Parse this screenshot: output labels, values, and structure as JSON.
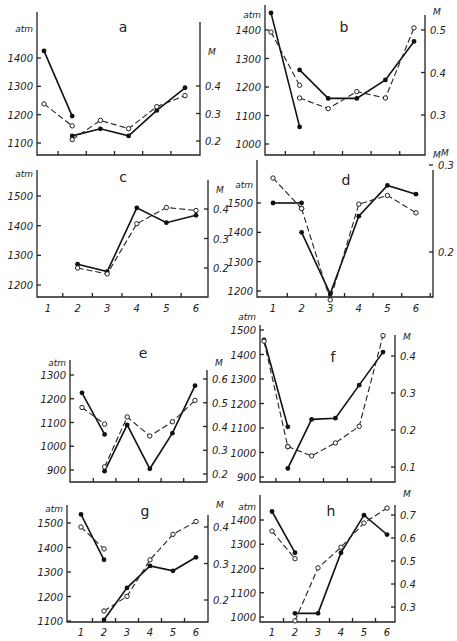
{
  "chart_data": [
    {
      "panel": "a",
      "type": "line",
      "left_axis": {
        "label": "atm",
        "ticks": [
          1100,
          1200,
          1300,
          1400
        ]
      },
      "right_axis": {
        "label": "M",
        "ticks": [
          0.2,
          0.3,
          0.4
        ]
      },
      "x": [
        1,
        2,
        3,
        4,
        5,
        6
      ],
      "series": [
        {
          "name": "pressure (atm)",
          "style": "solid-filled",
          "segments": [
            [
              [
                1,
                1425
              ],
              [
                2,
                1195
              ]
            ],
            [
              [
                2,
                1125
              ],
              [
                3,
                1150
              ],
              [
                4,
                1125
              ],
              [
                5,
                1215
              ],
              [
                6,
                1295
              ]
            ]
          ]
        },
        {
          "name": "M",
          "style": "dashed-open",
          "segments": [
            [
              [
                1,
                0.335
              ],
              [
                2,
                0.255
              ]
            ],
            [
              [
                2,
                0.205
              ],
              [
                3,
                0.275
              ],
              [
                4,
                0.245
              ],
              [
                5,
                0.325
              ],
              [
                6,
                0.365
              ]
            ]
          ]
        }
      ]
    },
    {
      "panel": "b",
      "type": "line",
      "left_axis": {
        "label": "atm",
        "ticks": [
          1000,
          1100,
          1200,
          1300,
          1400
        ]
      },
      "right_axis": {
        "label": "M",
        "ticks": [
          0.3,
          0.4,
          0.5
        ]
      },
      "x": [
        1,
        2,
        3,
        4,
        5,
        6
      ],
      "series": [
        {
          "name": "pressure (atm)",
          "style": "solid-filled",
          "segments": [
            [
              [
                1,
                1460
              ],
              [
                2,
                1060
              ]
            ],
            [
              [
                2,
                1260
              ],
              [
                3,
                1160
              ],
              [
                4,
                1160
              ],
              [
                5,
                1225
              ],
              [
                6,
                1360
              ]
            ]
          ]
        },
        {
          "name": "M",
          "style": "dashed-open",
          "segments": [
            [
              [
                1,
                0.495
              ],
              [
                2,
                0.37
              ]
            ],
            [
              [
                2,
                0.34
              ],
              [
                3,
                0.315
              ],
              [
                4,
                0.355
              ],
              [
                5,
                0.34
              ],
              [
                6,
                0.505
              ]
            ]
          ]
        }
      ]
    },
    {
      "panel": "c",
      "type": "line",
      "left_axis": {
        "label": "atm",
        "ticks": [
          1200,
          1300,
          1400,
          1500
        ]
      },
      "right_axis": {
        "label": "M",
        "ticks": [
          0.2,
          0.3,
          0.4
        ]
      },
      "x": [
        1,
        2,
        3,
        4,
        5,
        6
      ],
      "series": [
        {
          "name": "pressure (atm)",
          "style": "solid-filled",
          "segments": [
            [
              [
                2,
                1270
              ],
              [
                3,
                1245
              ],
              [
                4,
                1460
              ],
              [
                5,
                1410
              ],
              [
                6,
                1435
              ]
            ]
          ]
        },
        {
          "name": "M",
          "style": "dashed-open",
          "segments": [
            [
              [
                2,
                0.2
              ],
              [
                3,
                0.18
              ],
              [
                4,
                0.35
              ],
              [
                5,
                0.405
              ],
              [
                6,
                0.395
              ]
            ]
          ]
        }
      ]
    },
    {
      "panel": "d",
      "type": "line",
      "left_axis": {
        "label": "atm",
        "ticks": [
          1200,
          1300,
          1400,
          1500
        ]
      },
      "right_axis": {
        "label": "M",
        "ticks": [
          0.2,
          0.3
        ]
      },
      "x": [
        1,
        2,
        3,
        4,
        5,
        6
      ],
      "series": [
        {
          "name": "pressure (atm)",
          "style": "solid-filled",
          "segments": [
            [
              [
                1,
                1500
              ],
              [
                2,
                1500
              ]
            ],
            [
              [
                2,
                1400
              ],
              [
                3,
                1190
              ],
              [
                4,
                1455
              ],
              [
                5,
                1560
              ],
              [
                6,
                1530
              ]
            ]
          ]
        },
        {
          "name": "M",
          "style": "dashed-open",
          "segments": [
            [
              [
                1,
                0.285
              ],
              [
                2,
                0.25
              ]
            ],
            [
              [
                2,
                0.25
              ],
              [
                3,
                0.145
              ],
              [
                4,
                0.255
              ],
              [
                5,
                0.265
              ],
              [
                6,
                0.245
              ]
            ]
          ]
        }
      ]
    },
    {
      "panel": "e",
      "type": "line",
      "left_axis": {
        "label": "atm",
        "ticks": [
          900,
          1000,
          1100,
          1200,
          1300
        ]
      },
      "right_axis": {
        "label": "M",
        "ticks": [
          0.2,
          0.3,
          0.4,
          0.5,
          0.6
        ]
      },
      "x": [
        1,
        2,
        3,
        4,
        5,
        6
      ],
      "series": [
        {
          "name": "pressure (atm)",
          "style": "solid-filled",
          "segments": [
            [
              [
                1,
                1225
              ],
              [
                2,
                1050
              ]
            ],
            [
              [
                2,
                895
              ],
              [
                3,
                1090
              ],
              [
                4,
                905
              ],
              [
                5,
                1055
              ],
              [
                6,
                1255
              ]
            ]
          ]
        },
        {
          "name": "M",
          "style": "dashed-open",
          "segments": [
            [
              [
                1,
                0.48
              ],
              [
                2,
                0.41
              ]
            ],
            [
              [
                2,
                0.23
              ],
              [
                3,
                0.44
              ],
              [
                4,
                0.36
              ],
              [
                5,
                0.42
              ],
              [
                6,
                0.51
              ]
            ]
          ]
        }
      ]
    },
    {
      "panel": "f",
      "type": "line",
      "left_axis": {
        "label": "atm",
        "ticks": [
          900,
          1000,
          1100,
          1200,
          1300,
          1400,
          1500
        ]
      },
      "right_axis": {
        "label": "M",
        "ticks": [
          0.1,
          0.2,
          0.3,
          0.4
        ]
      },
      "x": [
        1,
        2,
        3,
        4,
        5,
        6
      ],
      "series": [
        {
          "name": "pressure (atm)",
          "style": "solid-filled",
          "segments": [
            [
              [
                1,
                1460
              ],
              [
                2,
                1105
              ]
            ],
            [
              [
                2,
                935
              ],
              [
                3,
                1135
              ],
              [
                4,
                1140
              ],
              [
                5,
                1275
              ],
              [
                6,
                1410
              ]
            ]
          ]
        },
        {
          "name": "M",
          "style": "dashed-open",
          "segments": [
            [
              [
                1,
                0.44
              ],
              [
                2,
                0.155
              ]
            ],
            [
              [
                2,
                0.155
              ],
              [
                3,
                0.13
              ],
              [
                4,
                0.165
              ],
              [
                5,
                0.21
              ],
              [
                6,
                0.455
              ]
            ]
          ]
        }
      ]
    },
    {
      "panel": "g",
      "type": "line",
      "left_axis": {
        "label": "atm",
        "ticks": [
          1100,
          1200,
          1300,
          1400,
          1500
        ]
      },
      "right_axis": {
        "label": "M",
        "ticks": [
          0.2,
          0.3,
          0.4
        ]
      },
      "x": [
        1,
        2,
        3,
        4,
        5,
        6
      ],
      "x_tick_labels": [
        "1",
        "2",
        "3",
        "4",
        "5",
        "6"
      ],
      "series": [
        {
          "name": "pressure (atm)",
          "style": "solid-filled",
          "segments": [
            [
              [
                1,
                1535
              ],
              [
                2,
                1350
              ]
            ],
            [
              [
                2,
                1105
              ],
              [
                3,
                1235
              ],
              [
                4,
                1325
              ],
              [
                5,
                1305
              ],
              [
                6,
                1360
              ]
            ]
          ]
        },
        {
          "name": "M",
          "style": "dashed-open",
          "segments": [
            [
              [
                1,
                0.4
              ],
              [
                2,
                0.34
              ]
            ],
            [
              [
                2,
                0.17
              ],
              [
                3,
                0.21
              ],
              [
                4,
                0.31
              ],
              [
                5,
                0.38
              ],
              [
                6,
                0.415
              ]
            ]
          ]
        }
      ]
    },
    {
      "panel": "h",
      "type": "line",
      "left_axis": {
        "label": "atm",
        "ticks": [
          1000,
          1100,
          1200,
          1300,
          1400
        ]
      },
      "right_axis": {
        "label": "M",
        "ticks": [
          0.3,
          0.4,
          0.5,
          0.6,
          0.7
        ]
      },
      "x": [
        1,
        2,
        3,
        4,
        5,
        6
      ],
      "x_tick_labels": [
        "1",
        "2",
        "3",
        "4",
        "5",
        "6"
      ],
      "series": [
        {
          "name": "pressure (atm)",
          "style": "solid-filled",
          "segments": [
            [
              [
                1,
                1435
              ],
              [
                2,
                1265
              ]
            ],
            [
              [
                2,
                1015
              ],
              [
                3,
                1015
              ],
              [
                4,
                1265
              ],
              [
                5,
                1420
              ],
              [
                6,
                1340
              ]
            ]
          ]
        },
        {
          "name": "M",
          "style": "dashed-open",
          "segments": [
            [
              [
                1,
                0.63
              ],
              [
                2,
                0.51
              ]
            ],
            [
              [
                2,
                0.24
              ],
              [
                3,
                0.47
              ],
              [
                4,
                0.56
              ],
              [
                5,
                0.665
              ],
              [
                6,
                0.73
              ]
            ]
          ]
        }
      ]
    }
  ],
  "panels_layout": {
    "a": {
      "left": 37,
      "right": 200,
      "top": 12,
      "bottom": 155,
      "x1": 44,
      "x6": 185,
      "atm_ref": [
        [
          1400,
          58
        ],
        [
          1100,
          143
        ]
      ],
      "m_ref": [
        [
          0.4,
          86
        ],
        [
          0.2,
          141
        ]
      ],
      "letter_x": 123,
      "letter_y": 32,
      "atm_label_y": 32,
      "m_label_y": 55,
      "x_labels": false
    },
    "b": {
      "left": 265,
      "right": 425,
      "top": 5,
      "bottom": 155,
      "x1": 271,
      "x6": 414,
      "atm_ref": [
        [
          1400,
          30
        ],
        [
          1000,
          144
        ]
      ],
      "m_ref": [
        [
          0.5,
          30
        ],
        [
          0.3,
          115
        ]
      ],
      "letter_x": 344,
      "letter_y": 32,
      "atm_label_y": 18,
      "m_label_y": 15,
      "x_labels": false,
      "m_label2_y": 158
    },
    "c": {
      "left": 37,
      "right": 208,
      "top": 170,
      "bottom": 297,
      "x1": 48,
      "x6": 196,
      "atm_ref": [
        [
          1500,
          196
        ],
        [
          1200,
          285
        ]
      ],
      "m_ref": [
        [
          0.4,
          209
        ],
        [
          0.2,
          268
        ]
      ],
      "letter_x": 123,
      "letter_y": 182,
      "atm_label_y": 177,
      "m_label_y": 193,
      "x_labels": true,
      "x_label_y": 312
    },
    "d": {
      "left": 257,
      "right": 433,
      "top": 160,
      "bottom": 297,
      "x1": 273,
      "x6": 416,
      "atm_ref": [
        [
          1500,
          203
        ],
        [
          1200,
          291
        ]
      ],
      "m_ref": [
        [
          0.3,
          165
        ],
        [
          0.2,
          252
        ]
      ],
      "letter_x": 346,
      "letter_y": 185,
      "atm_label_y": 188,
      "m_label_y": 156,
      "x_labels": true,
      "x_label_y": 312
    },
    "e": {
      "left": 70,
      "right": 207,
      "top": 360,
      "bottom": 482,
      "x1": 82,
      "x6": 195,
      "atm_ref": [
        [
          1300,
          375
        ],
        [
          900,
          470
        ]
      ],
      "m_ref": [
        [
          0.6,
          379
        ],
        [
          0.2,
          474
        ]
      ],
      "letter_x": 143,
      "letter_y": 358,
      "atm_label_y": 366,
      "m_label_y": 366,
      "x_labels": false
    },
    "f": {
      "left": 260,
      "right": 395,
      "top": 325,
      "bottom": 482,
      "x1": 264,
      "x6": 383,
      "atm_ref": [
        [
          1500,
          330
        ],
        [
          900,
          477
        ]
      ],
      "m_ref": [
        [
          0.4,
          356
        ],
        [
          0.1,
          467
        ]
      ],
      "letter_x": 333,
      "letter_y": 362,
      "atm_label_y": 320,
      "m_label_y": 340,
      "x_labels": false
    },
    "g": {
      "left": 67,
      "right": 208,
      "top": 505,
      "bottom": 622,
      "x1": 81,
      "x6": 196,
      "atm_ref": [
        [
          1500,
          523
        ],
        [
          1100,
          621
        ]
      ],
      "m_ref": [
        [
          0.4,
          527
        ],
        [
          0.2,
          600
        ]
      ],
      "letter_x": 145,
      "letter_y": 516,
      "atm_label_y": 512,
      "m_label_y": 508,
      "x_labels": true,
      "x_label_y": 636
    },
    "h": {
      "left": 260,
      "right": 395,
      "top": 495,
      "bottom": 622,
      "x1": 272,
      "x6": 387,
      "atm_ref": [
        [
          1400,
          520
        ],
        [
          1000,
          617
        ]
      ],
      "m_ref": [
        [
          0.7,
          515
        ],
        [
          0.3,
          607
        ]
      ],
      "letter_x": 331,
      "letter_y": 516,
      "atm_label_y": 510,
      "m_label_y": 497,
      "x_labels": true,
      "x_label_y": 636
    }
  },
  "labels": {
    "left_unit": "atm",
    "right_unit": "M"
  }
}
